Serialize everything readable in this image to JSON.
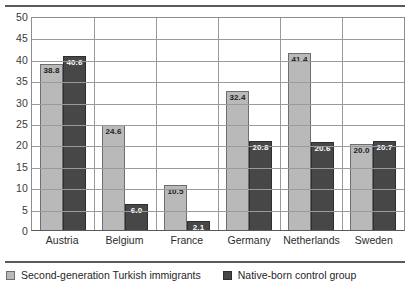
{
  "chart_data": {
    "type": "bar",
    "title": "",
    "xlabel": "",
    "ylabel": "",
    "ylim": [
      0,
      50
    ],
    "yticks": [
      50,
      45,
      40,
      35,
      30,
      25,
      20,
      15,
      10,
      5,
      0
    ],
    "grid": true,
    "legend_position": "bottom-left",
    "categories": [
      "Austria",
      "Belgium",
      "France",
      "Germany",
      "Netherlands",
      "Sweden"
    ],
    "series": [
      {
        "name": "Second-generation Turkish immigrants",
        "color": "#b9b9b9",
        "values": [
          38.8,
          24.6,
          10.5,
          32.4,
          41.4,
          20.0
        ],
        "labels": [
          "38.8",
          "24.6",
          "10.5",
          "32.4",
          "41.4",
          "20.0"
        ]
      },
      {
        "name": "Native-born control group",
        "color": "#474747",
        "values": [
          40.6,
          6.0,
          2.1,
          20.8,
          20.6,
          20.7
        ],
        "labels": [
          "40.6",
          "6.0",
          "2.1",
          "20.8",
          "20.6",
          "20.7"
        ]
      }
    ]
  },
  "legend": {
    "items": [
      {
        "label": "Second-generation Turkish immigrants",
        "swatch": "light"
      },
      {
        "label": "Native-born control group",
        "swatch": "dark"
      }
    ]
  }
}
